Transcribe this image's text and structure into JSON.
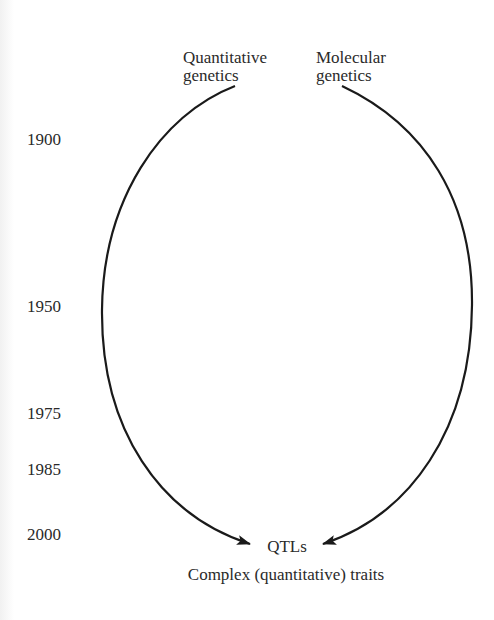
{
  "diagram": {
    "title": "",
    "top_left_label": [
      "Quantitative",
      "genetics"
    ],
    "top_right_label": [
      "Molecular",
      "genetics"
    ],
    "convergence_label": "QTLs",
    "bottom_label": "Complex (quantitative) traits",
    "timeline": [
      {
        "year": "1900"
      },
      {
        "year": "1950"
      },
      {
        "year": "1975"
      },
      {
        "year": "1985"
      },
      {
        "year": "2000"
      }
    ],
    "line_color": "#1a1a1a",
    "text_color": "#2a2a2a"
  }
}
